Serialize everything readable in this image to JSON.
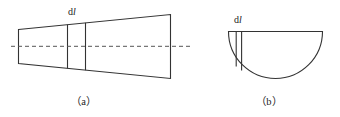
{
  "figure": {
    "background_color": "#ffffff",
    "stroke_color": "#333333",
    "text_color": "#1b1b1b",
    "panels": [
      {
        "id": "panel-a",
        "caption": "（a）",
        "shape": "truncated-cone-side-view",
        "element_label_prefix": "d",
        "element_label_italic": "l",
        "centerline": "dashed-axis-of-symmetry"
      },
      {
        "id": "panel-b",
        "caption": "（b）",
        "shape": "semicircular-disc",
        "element_label_prefix": "d",
        "element_label_italic": "l",
        "centerline": "none"
      }
    ],
    "labels": {
      "dl_a_prefix": "d",
      "dl_a_italic": "l",
      "dl_b_prefix": "d",
      "dl_b_italic": "l",
      "caption_a": "（a）",
      "caption_b": "（b）"
    }
  }
}
